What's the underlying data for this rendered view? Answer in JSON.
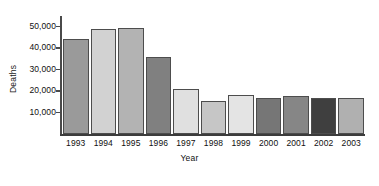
{
  "chart_data": {
    "type": "bar",
    "title": "",
    "xlabel": "Year",
    "ylabel": "Deaths",
    "categories": [
      "1993",
      "1994",
      "1995",
      "1996",
      "1997",
      "1998",
      "1999",
      "2000",
      "2001",
      "2002",
      "2003"
    ],
    "values": [
      44500,
      49000,
      49500,
      36000,
      21000,
      15500,
      18000,
      17000,
      17500,
      16800,
      17000
    ],
    "bar_colors": [
      "#9a9a9a",
      "#d2d2d2",
      "#b3b3b3",
      "#808080",
      "#e0e0e0",
      "#c6c6c6",
      "#e4e4e4",
      "#767676",
      "#868686",
      "#3f3f3f",
      "#b0b0b0"
    ],
    "bar_edge_color": "#4d4d4d",
    "ylim": [
      0,
      55000
    ],
    "ytick_values": [
      10000,
      20000,
      30000,
      40000,
      50000
    ],
    "ytick_labels": [
      "10,000",
      "20,000",
      "30,000",
      "40,000",
      "50,000"
    ],
    "grid": false,
    "legend": "none",
    "axis_color": "#4a4a4a",
    "background_color": "#ffffff"
  }
}
